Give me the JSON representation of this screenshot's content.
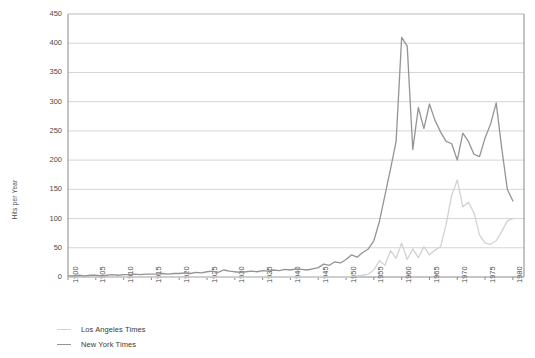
{
  "chart_data": {
    "type": "line",
    "title": "",
    "xlabel": "",
    "ylabel": "Hits per Year",
    "xlim": [
      1900,
      1982
    ],
    "ylim": [
      0,
      450
    ],
    "grid": true,
    "legend_position": "bottom-left",
    "ytick_labels": [
      "450",
      "400",
      "350",
      "300",
      "250",
      "200",
      "150",
      "100",
      "50",
      "0"
    ],
    "ytick_values": [
      450,
      400,
      350,
      300,
      250,
      200,
      150,
      100,
      50,
      0
    ],
    "xtick_labels": [
      "1900",
      "1905",
      "1910",
      "1915",
      "1920",
      "1925",
      "1930",
      "1935",
      "1940",
      "1945",
      "1950",
      "1955",
      "1960",
      "1965",
      "1970",
      "1975",
      "1980"
    ],
    "xtick_values": [
      1900,
      1905,
      1910,
      1915,
      1920,
      1925,
      1930,
      1935,
      1940,
      1945,
      1950,
      1955,
      1960,
      1965,
      1970,
      1975,
      1980
    ],
    "x": [
      1900,
      1901,
      1902,
      1903,
      1904,
      1905,
      1906,
      1907,
      1908,
      1909,
      1910,
      1911,
      1912,
      1913,
      1914,
      1915,
      1916,
      1917,
      1918,
      1919,
      1920,
      1921,
      1922,
      1923,
      1924,
      1925,
      1926,
      1927,
      1928,
      1929,
      1930,
      1931,
      1932,
      1933,
      1934,
      1935,
      1936,
      1937,
      1938,
      1939,
      1940,
      1941,
      1942,
      1943,
      1944,
      1945,
      1946,
      1947,
      1948,
      1949,
      1950,
      1951,
      1952,
      1953,
      1954,
      1955,
      1956,
      1957,
      1958,
      1959,
      1960,
      1961,
      1962,
      1963,
      1964,
      1965,
      1966,
      1967,
      1968,
      1969,
      1970,
      1971,
      1972,
      1973,
      1974,
      1975,
      1976,
      1977,
      1978,
      1979,
      1980
    ],
    "series": [
      {
        "name": "Los Angeles Times",
        "color": "#d2d2d2",
        "values": [
          0,
          0,
          0,
          0,
          0,
          0,
          0,
          0,
          0,
          0,
          0,
          0,
          0,
          0,
          0,
          0,
          0,
          0,
          0,
          0,
          0,
          0,
          0,
          0,
          0,
          0,
          0,
          0,
          0,
          0,
          0,
          0,
          0,
          0,
          0,
          0,
          0,
          0,
          0,
          0,
          0,
          0,
          0,
          0,
          0,
          0,
          0,
          0,
          0,
          0,
          0,
          1,
          2,
          3,
          5,
          12,
          28,
          20,
          45,
          32,
          58,
          30,
          48,
          33,
          52,
          38,
          46,
          52,
          90,
          140,
          166,
          120,
          128,
          110,
          72,
          58,
          56,
          62,
          78,
          96,
          100
        ]
      },
      {
        "name": "New York Times",
        "color": "#949494",
        "values": [
          2,
          2,
          3,
          2,
          3,
          3,
          2,
          3,
          4,
          3,
          4,
          4,
          5,
          4,
          5,
          5,
          5,
          6,
          5,
          6,
          6,
          7,
          6,
          8,
          7,
          9,
          10,
          8,
          12,
          10,
          9,
          8,
          9,
          10,
          9,
          11,
          10,
          12,
          11,
          13,
          12,
          14,
          13,
          12,
          14,
          16,
          22,
          20,
          26,
          24,
          30,
          38,
          34,
          42,
          48,
          62,
          95,
          140,
          185,
          232,
          410,
          395,
          218,
          290,
          254,
          296,
          268,
          248,
          232,
          228,
          200,
          246,
          232,
          210,
          206,
          238,
          262,
          298,
          220,
          150,
          130
        ]
      }
    ]
  },
  "legend": {
    "items": [
      {
        "label": "Los Angeles Times",
        "color": "#d2d2d2"
      },
      {
        "label": "New York Times",
        "color": "#949494"
      }
    ]
  }
}
